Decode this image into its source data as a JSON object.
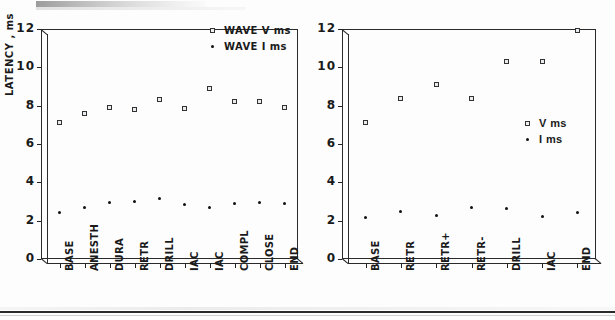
{
  "page": {
    "title_smudge": "",
    "bottom_rule": "horizontal-rule"
  },
  "chart_data": [
    {
      "id": "left",
      "type": "scatter",
      "title": "",
      "xlabel": "",
      "ylabel": "LATENCY , ms",
      "ylim": [
        0,
        12
      ],
      "yticks": [
        0,
        2,
        4,
        6,
        8,
        10,
        12
      ],
      "grid": false,
      "legend_position": "upper-right",
      "categories": [
        "BASE",
        "ANESTH",
        "DURA",
        "RETR",
        "DRILL",
        "IAC",
        "IAC",
        "COMPL",
        "CLOSE",
        "END"
      ],
      "series": [
        {
          "name": "WAVE V ms",
          "marker": "open-square",
          "values": [
            7.1,
            7.6,
            7.9,
            7.8,
            8.3,
            7.85,
            8.9,
            8.2,
            8.2,
            7.9
          ]
        },
        {
          "name": "WAVE I ms",
          "marker": "filled-dot",
          "values": [
            2.45,
            2.7,
            2.95,
            3.0,
            3.15,
            2.85,
            2.7,
            2.9,
            2.95,
            2.9
          ]
        }
      ]
    },
    {
      "id": "right",
      "type": "scatter",
      "title": "",
      "xlabel": "",
      "ylabel": "",
      "ylim": [
        0,
        12
      ],
      "yticks": [
        0,
        2,
        4,
        6,
        8,
        10,
        12
      ],
      "grid": false,
      "legend_position": "middle-right",
      "categories": [
        "BASE",
        "RETR",
        "RETR+",
        "RETR-",
        "DRILL",
        "IAC",
        "END"
      ],
      "series": [
        {
          "name": "V ms",
          "marker": "open-square",
          "values": [
            7.1,
            8.4,
            9.1,
            8.4,
            10.3,
            10.3,
            11.9
          ]
        },
        {
          "name": "I ms",
          "marker": "filled-dot",
          "values": [
            2.15,
            2.5,
            2.25,
            2.7,
            2.65,
            2.2,
            2.45
          ]
        }
      ]
    }
  ],
  "left_chart": {
    "ylabel": "LATENCY , ms",
    "yticks": [
      "12",
      "10",
      "8",
      "6",
      "4",
      "2",
      "0"
    ],
    "xlabels": [
      "BASE",
      "ANESTH",
      "DURA",
      "RETR",
      "DRILL",
      "IAC",
      "IAC",
      "COMPL",
      "CLOSE",
      "END"
    ],
    "legend": [
      {
        "label": "WAVE V ms",
        "marker": "open-square"
      },
      {
        "label": "WAVE I ms",
        "marker": "filled-dot"
      }
    ]
  },
  "right_chart": {
    "yticks": [
      "12",
      "10",
      "8",
      "6",
      "4",
      "2",
      "0"
    ],
    "xlabels": [
      "BASE",
      "RETR",
      "RETR+",
      "RETR-",
      "DRILL",
      "IAC",
      "END"
    ],
    "legend": [
      {
        "label": "V ms",
        "marker": "open-square"
      },
      {
        "label": "I ms",
        "marker": "filled-dot"
      }
    ]
  }
}
